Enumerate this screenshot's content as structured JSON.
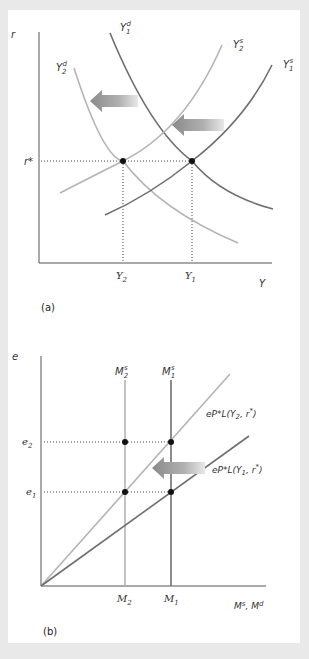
{
  "figure": {
    "panel_a": {
      "caption": "(a)",
      "y_axis_label": "r",
      "x_axis_label": "Y",
      "equilibrium_rate_label": "r*",
      "x_ticks": [
        {
          "base": "Y",
          "sub": "2"
        },
        {
          "base": "Y",
          "sub": "1"
        }
      ],
      "curves": [
        {
          "base": "Y",
          "sub": "1",
          "sup": "d",
          "shade": "dark",
          "type": "demand"
        },
        {
          "base": "Y",
          "sub": "2",
          "sup": "d",
          "shade": "light",
          "type": "demand"
        },
        {
          "base": "Y",
          "sub": "2",
          "sup": "s",
          "shade": "light",
          "type": "supply"
        },
        {
          "base": "Y",
          "sub": "1",
          "sup": "s",
          "shade": "dark",
          "type": "supply"
        }
      ],
      "arrows": [
        "shift-left-demand",
        "shift-left-supply"
      ]
    },
    "panel_b": {
      "caption": "(b)",
      "y_axis_label": "e",
      "x_axis_label": "Ms, Md",
      "x_axis_label_parts": {
        "a": "M",
        "a_sup": "s",
        "b": "M",
        "b_sup": "d"
      },
      "y_ticks": [
        {
          "base": "e",
          "sub": "2"
        },
        {
          "base": "e",
          "sub": "1"
        }
      ],
      "x_ticks": [
        {
          "base": "M",
          "sub": "2"
        },
        {
          "base": "M",
          "sub": "1"
        }
      ],
      "supply_lines": [
        {
          "base": "M",
          "sub": "2",
          "sup": "s",
          "shade": "light"
        },
        {
          "base": "M",
          "sub": "1",
          "sup": "s",
          "shade": "dark"
        }
      ],
      "demand_lines": [
        {
          "label": "eP*L(Y2, r*)",
          "prefix": "eP*L(Y",
          "sub": "2",
          "suffix": ", r",
          "sup": "*",
          "close": ")",
          "shade": "light"
        },
        {
          "label": "eP*L(Y1, r*)",
          "prefix": "eP*L(Y",
          "sub": "1",
          "suffix": ", r",
          "sup": "*",
          "close": ")",
          "shade": "dark"
        }
      ],
      "arrows": [
        "shift-left-money-supply"
      ]
    },
    "colors": {
      "dark_line": "#6e6e6e",
      "light_line": "#b4b4b4",
      "axis": "#555555",
      "background": "#e9e9e9",
      "panel": "#ffffff"
    }
  }
}
